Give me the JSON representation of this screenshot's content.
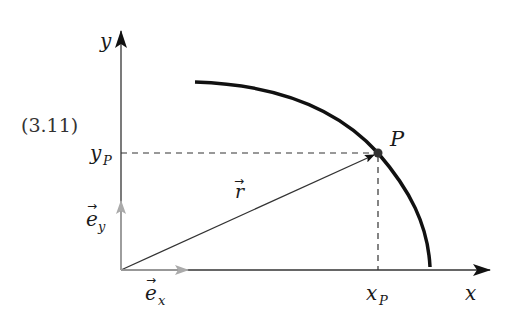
{
  "diagram": {
    "equation_number": "(3.11)",
    "axes": {
      "x_label": "x",
      "y_label": "y",
      "origin": [
        121,
        270
      ],
      "x_end": [
        490,
        270
      ],
      "y_end": [
        121,
        30
      ]
    },
    "unit_vectors": {
      "ex_label": "e",
      "ex_sub": "x",
      "ey_label": "e",
      "ey_sub": "y",
      "color": "#aaaaaa"
    },
    "position_vector": {
      "label": "r",
      "tip": [
        378,
        153
      ]
    },
    "point": {
      "label": "P",
      "x_tick_label": "x",
      "x_tick_sub": "P",
      "y_tick_label": "y",
      "y_tick_sub": "P"
    },
    "curve": {
      "description": "circular arc through P",
      "color": "#111111"
    },
    "colors": {
      "axis": "#333333",
      "curve": "#111111",
      "dashed": "#333333",
      "unit": "#aaaaaa"
    }
  }
}
